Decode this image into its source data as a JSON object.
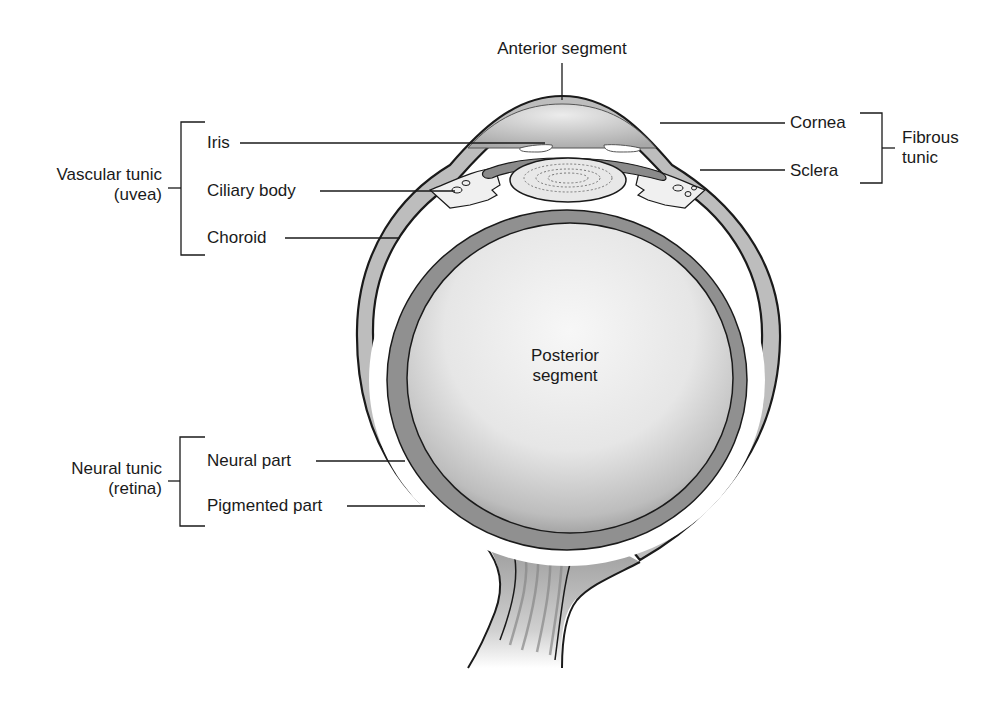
{
  "diagram": {
    "labels": {
      "anterior_segment": "Anterior segment",
      "posterior_segment_line1": "Posterior",
      "posterior_segment_line2": "segment",
      "cornea": "Cornea",
      "sclera": "Sclera",
      "fibrous_tunic_line1": "Fibrous",
      "fibrous_tunic_line2": "tunic",
      "iris": "Iris",
      "ciliary_body": "Ciliary body",
      "choroid": "Choroid",
      "vascular_tunic_line1": "Vascular tunic",
      "vascular_tunic_line2": "(uvea)",
      "neural_part": "Neural part",
      "pigmented_part": "Pigmented part",
      "neural_tunic_line1": "Neural tunic",
      "neural_tunic_line2": "(retina)"
    },
    "groups": [
      {
        "name": "Vascular tunic (uvea)",
        "members": [
          "Iris",
          "Ciliary body",
          "Choroid"
        ]
      },
      {
        "name": "Fibrous tunic",
        "members": [
          "Cornea",
          "Sclera"
        ]
      },
      {
        "name": "Neural tunic (retina)",
        "members": [
          "Neural part",
          "Pigmented part"
        ]
      }
    ],
    "colors": {
      "outline": "#1a1a1a",
      "sclera_fill": "#bdbdbd",
      "choroid_fill": "#8f8f8f",
      "vitreous_light": "#f2f2f2",
      "vitreous_dark": "#9a9a9a",
      "background": "#ffffff"
    }
  }
}
